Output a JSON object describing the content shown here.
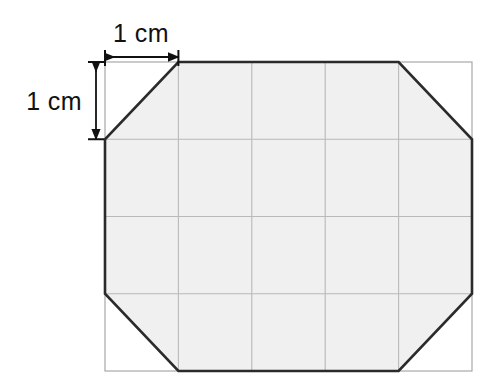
{
  "figure": {
    "type": "geometry-diagram",
    "canvas": {
      "width": 485,
      "height": 391
    },
    "colors": {
      "background": "#ffffff",
      "shape_fill": "#f0f0f0",
      "shape_outline": "#2b2b2b",
      "grid_line": "#b9b9b9",
      "grid_border": "#a8a8a8",
      "dimension_line": "#111111",
      "label_text": "#111111"
    },
    "grid": {
      "columns": 5,
      "rows": 4,
      "cell_width_px": 73.4,
      "cell_height_px": 77.25,
      "cell_size_label": "1 cm",
      "origin_x": 105,
      "origin_y": 62,
      "right_x": 472,
      "bottom_y": 371,
      "vertical_line_x": [
        105,
        178.4,
        251.8,
        325.2,
        398.6,
        472
      ],
      "horizontal_line_y": [
        62,
        139.25,
        216.5,
        293.75,
        371
      ]
    },
    "shape": {
      "name": "octagon",
      "sides": 8,
      "corner_cut_cells": 1,
      "vertices": [
        {
          "x": 178.4,
          "y": 62
        },
        {
          "x": 398.6,
          "y": 62
        },
        {
          "x": 472,
          "y": 139.25
        },
        {
          "x": 472,
          "y": 293.75
        },
        {
          "x": 398.6,
          "y": 371
        },
        {
          "x": 178.4,
          "y": 371
        },
        {
          "x": 105,
          "y": 293.75
        },
        {
          "x": 105,
          "y": 139.25
        }
      ]
    },
    "dimensions": [
      {
        "id": "horizontal",
        "label": "1 cm",
        "orientation": "horizontal",
        "measures": "one grid cell width",
        "line_x1": 105,
        "line_x2": 178.4,
        "line_y": 57,
        "label_x": 141,
        "label_y": 42
      },
      {
        "id": "vertical",
        "label": "1 cm",
        "orientation": "vertical",
        "measures": "one grid cell height",
        "line_x": 96,
        "line_y1": 62,
        "line_y2": 139.25,
        "label_x": 60,
        "label_y": 109
      }
    ]
  }
}
